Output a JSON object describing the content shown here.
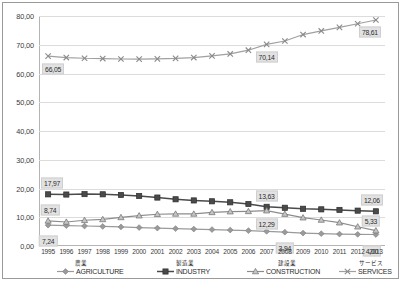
{
  "chart_data": {
    "type": "line",
    "title": "",
    "xlabel": "",
    "ylabel": "",
    "ylim": [
      0,
      80
    ],
    "ytick_step": 10,
    "grid": true,
    "legend_position": "bottom",
    "categories": [
      "1995",
      "1996",
      "1997",
      "1998",
      "1999",
      "2000",
      "2001",
      "2002",
      "2003",
      "2004",
      "2005",
      "2006",
      "2007",
      "2008",
      "2009",
      "2010",
      "2011",
      "2012",
      "2013"
    ],
    "series": [
      {
        "name": "AGRICULTURE",
        "name_jp": "農業",
        "color": "#9a9a9a",
        "marker": "diamond",
        "values": [
          7.24,
          7.1,
          6.95,
          6.8,
          6.62,
          6.42,
          6.22,
          6.05,
          5.9,
          5.72,
          5.55,
          5.35,
          5.1,
          4.8,
          4.5,
          4.3,
          4.15,
          4.05,
          4.0
        ],
        "labels": [
          {
            "category": "1995",
            "value": "7,24"
          },
          {
            "category": "2008",
            "value": "3,94"
          },
          {
            "category": "2013",
            "value": "4,00"
          }
        ]
      },
      {
        "name": "INDUSTRY",
        "name_jp": "製造業",
        "color": "#4a4a4a",
        "marker": "square",
        "values": [
          17.97,
          17.9,
          18.05,
          17.98,
          17.75,
          17.4,
          16.85,
          16.25,
          15.85,
          15.55,
          15.2,
          14.6,
          13.63,
          13.3,
          12.95,
          12.75,
          12.55,
          12.3,
          12.06
        ],
        "labels": [
          {
            "category": "1995",
            "value": "17,97"
          },
          {
            "category": "2007",
            "value": "13,63"
          },
          {
            "category": "2013",
            "value": "12,06"
          }
        ]
      },
      {
        "name": "CONSTRUCTION",
        "name_jp": "建設業",
        "color": "#8c8c8c",
        "marker": "triangle",
        "values": [
          8.74,
          8.35,
          8.95,
          9.25,
          9.95,
          10.55,
          11.05,
          11.15,
          11.15,
          11.7,
          11.95,
          12.05,
          12.29,
          11.1,
          9.85,
          9.05,
          8.1,
          6.7,
          5.33
        ],
        "labels": [
          {
            "category": "1995",
            "value": "8,74"
          },
          {
            "category": "2007",
            "value": "12,29"
          },
          {
            "category": "2013",
            "value": "5,33"
          }
        ]
      },
      {
        "name": "SERVICES",
        "name_jp": "サービス",
        "color": "#a0a0a0",
        "marker": "x",
        "values": [
          66.05,
          65.55,
          65.3,
          65.2,
          65.05,
          65.0,
          65.1,
          65.25,
          65.55,
          66.15,
          66.8,
          68.1,
          70.14,
          71.3,
          73.55,
          74.8,
          76.05,
          77.3,
          78.61
        ],
        "labels": [
          {
            "category": "1995",
            "value": "66,05"
          },
          {
            "category": "2007",
            "value": "70,14"
          },
          {
            "category": "2013",
            "value": "78,61"
          }
        ]
      }
    ],
    "ytick_labels": [
      "0,00",
      "10,00",
      "20,00",
      "30,00",
      "40,00",
      "50,00",
      "60,00",
      "70,00",
      "80,00"
    ]
  }
}
